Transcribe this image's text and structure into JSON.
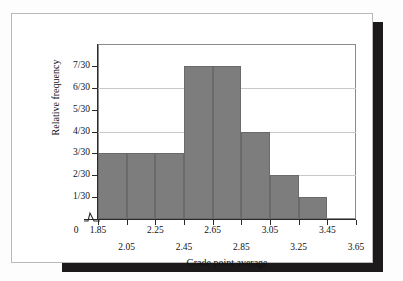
{
  "chart_data": {
    "type": "bar",
    "title": "",
    "subtitle": "",
    "xlabel": "Grade point average",
    "ylabel": "Relative frequency",
    "origin_label": "0",
    "categories": [
      "1.85-2.05",
      "2.05-2.25",
      "2.25-2.45",
      "2.45-2.65",
      "2.65-2.85",
      "2.85-3.05",
      "3.05-3.25",
      "3.25-3.45"
    ],
    "bin_edges": [
      1.85,
      2.05,
      2.25,
      2.45,
      2.65,
      2.85,
      3.05,
      3.25,
      3.45
    ],
    "values": [
      3,
      3,
      3,
      7,
      7,
      4,
      2,
      1
    ],
    "value_denominator": 30,
    "value_labels": [
      "3/30",
      "3/30",
      "3/30",
      "7/30",
      "7/30",
      "4/30",
      "2/30",
      "1/30"
    ],
    "xlim": [
      1.85,
      3.65
    ],
    "ylim": [
      0,
      8
    ],
    "x_ticks": [
      1.85,
      2.05,
      2.25,
      2.45,
      2.65,
      2.85,
      3.05,
      3.25,
      3.45,
      3.65
    ],
    "x_tick_labels_row1": [
      "1.85",
      "2.25",
      "2.65",
      "3.05",
      "3.45"
    ],
    "x_tick_labels_row2": [
      "2.05",
      "2.45",
      "2.85",
      "3.25",
      "3.65"
    ],
    "y_ticks": [
      1,
      2,
      3,
      4,
      5,
      6,
      7
    ],
    "y_tick_labels": [
      "1/30",
      "2/30",
      "3/30",
      "4/30",
      "5/30",
      "6/30",
      "7/30"
    ],
    "gridlines_at": [
      2,
      4,
      6
    ],
    "grid": true,
    "legend": false,
    "bar_color": "#7d7d7d",
    "bar_edge_color": "#6a6a6a",
    "axis_color": "#2a2a2a",
    "grid_color": "#c9c9c9",
    "axis_break": true,
    "background_color": "#ffffff"
  },
  "xAxis": {
    "title": "Grade point average",
    "origin": "0",
    "row1": [
      {
        "label": "1.85",
        "value": 1.85
      },
      {
        "label": "2.25",
        "value": 2.25
      },
      {
        "label": "2.65",
        "value": 2.65
      },
      {
        "label": "3.05",
        "value": 3.05
      },
      {
        "label": "3.45",
        "value": 3.45
      }
    ],
    "row2": [
      {
        "label": "2.05",
        "value": 2.05
      },
      {
        "label": "2.45",
        "value": 2.45
      },
      {
        "label": "2.85",
        "value": 2.85
      },
      {
        "label": "3.25",
        "value": 3.25
      },
      {
        "label": "3.65",
        "value": 3.65
      }
    ]
  },
  "yAxis": {
    "title": "Relative frequency",
    "ticks": [
      {
        "label": "7/30",
        "value": 7
      },
      {
        "label": "6/30",
        "value": 6
      },
      {
        "label": "5/30",
        "value": 5
      },
      {
        "label": "4/30",
        "value": 4
      },
      {
        "label": "3/30",
        "value": 3
      },
      {
        "label": "2/30",
        "value": 2
      },
      {
        "label": "1/30",
        "value": 1
      }
    ]
  }
}
